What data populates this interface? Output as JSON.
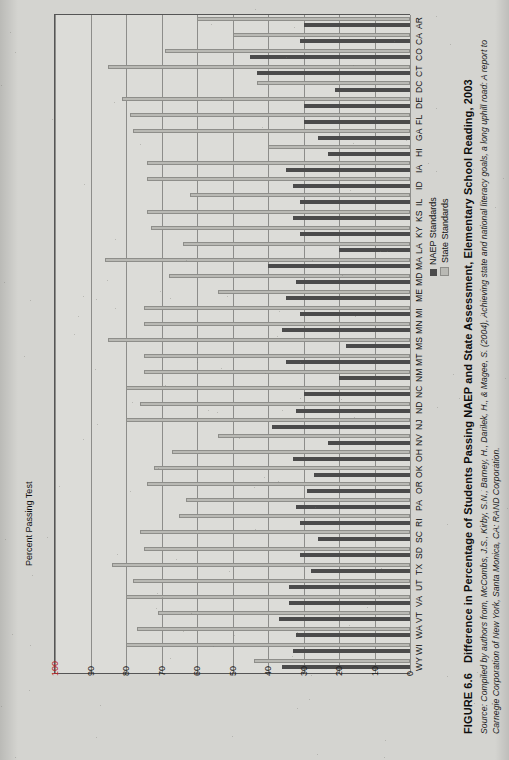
{
  "figure": {
    "number": "FIGURE 6.6",
    "title": "Difference in Percentage of Students Passing NAEP and State Assessment, Elementary School Reading, 2003",
    "source": "Source: Compiled by authors from, McCombs, J.S., Kirby, S.N., Barney, H., Darilek, H., & Magee, S. (2004), Achieving state and national literacy goals, a long uphill road: A report to Carnegie Corporation of New York, Santa Monica, CA: RAND Corporation."
  },
  "legend": {
    "position": "right",
    "entries": [
      {
        "label": "NAEP Standards",
        "color": "#4b4b4b"
      },
      {
        "label": "State Standards",
        "color": "#b9b9b4"
      }
    ]
  },
  "chart_data": {
    "type": "bar",
    "orientation": "horizontal-rotated",
    "title": "Difference in Percentage of Students Passing NAEP and State Assessment, Elementary School Reading, 2003",
    "xlabel": "",
    "ylabel": "Percent Passing Test",
    "ylim": [
      0,
      100
    ],
    "grid": true,
    "tick_labels": [
      "100",
      "90",
      "80",
      "70",
      "60",
      "50",
      "40",
      "30",
      "20",
      "10",
      "0"
    ],
    "tick_values": [
      100,
      90,
      80,
      70,
      60,
      50,
      40,
      30,
      20,
      10,
      0
    ],
    "axis_direction": "reversed",
    "categories": [
      "AR",
      "CA",
      "CO",
      "CT",
      "DC",
      "DE",
      "FL",
      "GA",
      "HI",
      "IA",
      "ID",
      "IL",
      "KS",
      "KY",
      "LA",
      "MA",
      "MD",
      "ME",
      "MI",
      "MN",
      "MS",
      "MT",
      "NM",
      "NC",
      "ND",
      "NJ",
      "NV",
      "OH",
      "OK",
      "OR",
      "PA",
      "RI",
      "SC",
      "SD",
      "TX",
      "UT",
      "VA",
      "VT",
      "WA",
      "WI",
      "WY"
    ],
    "series": [
      {
        "name": "State Standards",
        "color": "#b9b9b4",
        "values": [
          60,
          50,
          69,
          85,
          43,
          81,
          79,
          78,
          40,
          74,
          74,
          62,
          74,
          73,
          64,
          86,
          68,
          54,
          75,
          75,
          85,
          75,
          75,
          80,
          76,
          80,
          54,
          67,
          72,
          74,
          63,
          65,
          76,
          75,
          84,
          78,
          80,
          71,
          77,
          80,
          44
        ]
      },
      {
        "name": "NAEP Standards",
        "color": "#4b4b4b",
        "values": [
          30,
          31,
          45,
          43,
          21,
          30,
          30,
          26,
          23,
          35,
          33,
          31,
          33,
          31,
          20,
          40,
          32,
          35,
          31,
          36,
          18,
          35,
          20,
          30,
          32,
          39,
          23,
          33,
          27,
          29,
          32,
          31,
          26,
          31,
          28,
          34,
          34,
          37,
          32,
          33,
          36
        ]
      }
    ]
  }
}
